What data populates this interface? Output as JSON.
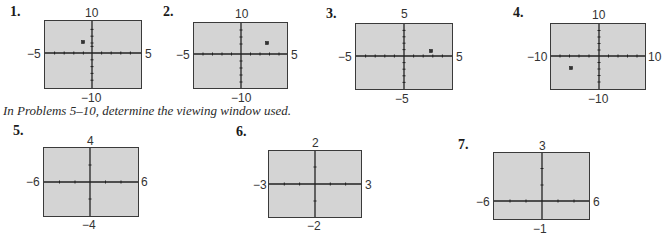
{
  "problems": [
    {
      "number": "1.",
      "xmin": "−5",
      "xmax": "5",
      "ymin": "−10",
      "ymax": "10",
      "point": {
        "x": -2,
        "y": 4
      }
    },
    {
      "number": "2.",
      "xmin": "−5",
      "xmax": "5",
      "ymin": "−10",
      "ymax": "10",
      "point": {
        "x": 3,
        "y": 4
      }
    },
    {
      "number": "3.",
      "xmin": "−5",
      "xmax": "5",
      "ymin": "−5",
      "ymax": "5",
      "point": {
        "x": 3,
        "y": 1
      }
    },
    {
      "number": "4.",
      "xmin": "−10",
      "xmax": "10",
      "ymin": "−10",
      "ymax": "10",
      "point": {
        "x": -6,
        "y": -4
      }
    },
    {
      "number": "5.",
      "xmin": "−6",
      "xmax": "6",
      "ymin": "−4",
      "ymax": "4"
    },
    {
      "number": "6.",
      "xmin": "−3",
      "xmax": "3",
      "ymin": "−2",
      "ymax": "2"
    },
    {
      "number": "7.",
      "xmin": "−6",
      "xmax": "6",
      "ymin": "−1",
      "ymax": "3"
    }
  ],
  "instruction": "In Problems 5–10, determine the viewing window used."
}
